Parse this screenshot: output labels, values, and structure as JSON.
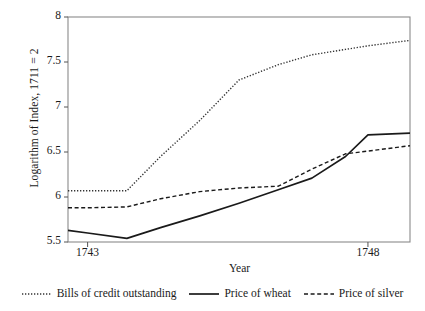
{
  "chart_data": {
    "type": "line",
    "title": "",
    "subtitle": "",
    "xlabel": "Year",
    "ylabel": "Logarithm of Index, 1711 = 2",
    "xlim": [
      1742.65,
      1748.75
    ],
    "ylim": [
      5.5,
      8.0
    ],
    "xticks": [
      1743,
      1748
    ],
    "xtick_labels": [
      "1743",
      "1748"
    ],
    "yticks": [
      5.5,
      6,
      6.5,
      7,
      7.5,
      8
    ],
    "ytick_labels": [
      "5.5",
      "6",
      "6.5",
      "7",
      "7.5",
      "8"
    ],
    "grid": false,
    "legend_position": "below",
    "x": [
      1742.65,
      1743.0,
      1743.7,
      1744.3,
      1745.0,
      1745.7,
      1746.4,
      1747.0,
      1747.6,
      1748.0,
      1748.75
    ],
    "series": [
      {
        "name": "Bills of credit outstanding",
        "style": "dotted",
        "color": "#333333",
        "values": [
          6.07,
          6.07,
          6.07,
          6.45,
          6.85,
          7.3,
          7.47,
          7.58,
          7.64,
          7.68,
          7.74
        ]
      },
      {
        "name": "Price of wheat",
        "style": "solid",
        "color": "#1a1a1a",
        "values": [
          5.63,
          5.6,
          5.54,
          5.66,
          5.79,
          5.93,
          6.08,
          6.21,
          6.45,
          6.69,
          6.71
        ]
      },
      {
        "name": "Price of silver",
        "style": "dashed",
        "color": "#1a1a1a",
        "values": [
          5.88,
          5.88,
          5.89,
          5.98,
          6.06,
          6.1,
          6.12,
          6.31,
          6.48,
          6.51,
          6.57
        ]
      }
    ]
  },
  "legend": {
    "entries": [
      {
        "label": "Bills of credit outstanding",
        "swatch": "dotted-line-swatch"
      },
      {
        "label": "Price of wheat",
        "swatch": "solid-line-swatch"
      },
      {
        "label": "Price of silver",
        "swatch": "dashed-line-swatch"
      }
    ]
  },
  "axes": {
    "y_title": "Logarithm of Index, 1711 = 2",
    "x_title": "Year"
  }
}
